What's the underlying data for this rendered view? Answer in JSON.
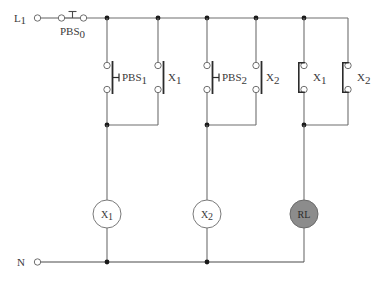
{
  "diagram": {
    "background_color": "#ffffff",
    "wire_color": "#6e6e6e",
    "node_color": "#1a1a1a",
    "text_color": "#3a3a3a",
    "lamp_fill_color": "#8c8c8c",
    "coil_fill_color": "#ffffff"
  },
  "terminals": [
    {
      "id": "line",
      "label": "L",
      "subscript": "1",
      "name": "line-terminal"
    },
    {
      "id": "neutral",
      "label": "N",
      "subscript": "",
      "name": "neutral-terminal"
    }
  ],
  "series_switch": {
    "label": "PBS",
    "subscript": "0",
    "type": "normally-closed-pushbutton",
    "name": "pbs0-pushbutton"
  },
  "branches": [
    {
      "id": "branch-1",
      "contacts": [
        {
          "label": "PBS",
          "subscript": "1",
          "type": "normally-open-pushbutton",
          "name": "pbs1-contact"
        },
        {
          "label": "X",
          "subscript": "1",
          "type": "normally-open-contact",
          "name": "x1-holding-contact"
        }
      ],
      "load": {
        "label": "RL",
        "display": "X",
        "subscript": "1",
        "type": "relay-coil",
        "name": "x1-coil"
      }
    },
    {
      "id": "branch-2",
      "contacts": [
        {
          "label": "PBS",
          "subscript": "2",
          "type": "normally-open-pushbutton",
          "name": "pbs2-contact"
        },
        {
          "label": "X",
          "subscript": "2",
          "type": "normally-open-contact",
          "name": "x2-holding-contact"
        }
      ],
      "load": {
        "label": "RL",
        "display": "X",
        "subscript": "2",
        "type": "relay-coil",
        "name": "x2-coil"
      }
    },
    {
      "id": "branch-3",
      "contacts": [
        {
          "label": "X",
          "subscript": "1",
          "type": "normally-closed-contact",
          "name": "x1-nc-contact"
        },
        {
          "label": "X",
          "subscript": "2",
          "type": "normally-closed-contact",
          "name": "x2-nc-contact"
        }
      ],
      "load": {
        "label": "RL",
        "display": "RL",
        "subscript": "",
        "type": "indicator-lamp",
        "name": "rl-lamp"
      }
    }
  ],
  "labels": {
    "l1_main": "L",
    "l1_sub": "1",
    "n_main": "N",
    "pbs0_main": "PBS",
    "pbs0_sub": "0",
    "pbs1_main": "PBS",
    "pbs1_sub": "1",
    "pbs2_main": "PBS",
    "pbs2_sub": "2",
    "x1_contact_main": "X",
    "x1_contact_sub": "1",
    "x2_contact_main": "X",
    "x2_contact_sub": "2",
    "x1_nc_main": "X",
    "x1_nc_sub": "1",
    "x2_nc_main": "X",
    "x2_nc_sub": "2",
    "x1_coil_main": "X",
    "x1_coil_sub": "1",
    "x2_coil_main": "X",
    "x2_coil_sub": "2",
    "rl_coil_main": "RL"
  }
}
